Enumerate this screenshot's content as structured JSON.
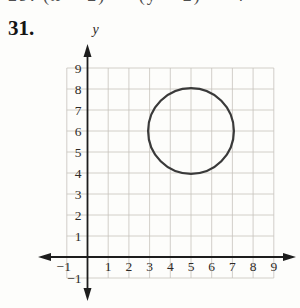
{
  "page": {
    "top_cropped_text": "29. (x − 2)² + (y − 2)² = 4",
    "problem_number": "31."
  },
  "chart_data": {
    "type": "line",
    "subtype": "circle-on-coordinate-grid",
    "title": "",
    "xlabel": "",
    "ylabel": "y",
    "xlim": [
      -1,
      9
    ],
    "ylim": [
      -1,
      9
    ],
    "x_tick_labels": [
      -1,
      1,
      2,
      3,
      4,
      5,
      6,
      7,
      8,
      9
    ],
    "y_tick_labels": [
      -1,
      1,
      2,
      3,
      4,
      5,
      6,
      7,
      8,
      9
    ],
    "grid": true,
    "axis_arrows": "both-ends",
    "circle": {
      "center": [
        5,
        6
      ],
      "radius": 2
    },
    "colors": {
      "grid": "#c6c3bc",
      "axis": "#1d1d1d",
      "circle": "#3a3a3a",
      "labels": "#2e2a26"
    }
  }
}
